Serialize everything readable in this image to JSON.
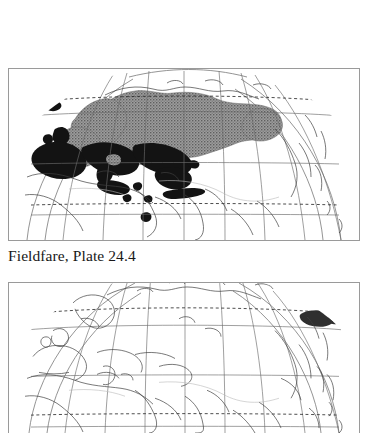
{
  "figure": {
    "caption": "Fieldfare, Plate 24.4",
    "species": "Fieldfare",
    "plate_number": "24.4",
    "background_color": "#ffffff",
    "frame_color": "#9a9a9a"
  },
  "maps": [
    {
      "id": "map-top",
      "name": "fieldfare-distribution-map",
      "projection": "globe-orthographic-eurasia",
      "coastline_color": "#3a3a3a",
      "graticule_color": "#6f6f6f",
      "ranges": [
        {
          "name": "breeding-range",
          "style": "stipple-gray",
          "color": "#8a8a8a",
          "region": "northern Eurasia: Scandinavia, northern and central Russia, Siberia"
        },
        {
          "name": "wintering-range",
          "style": "solid-black",
          "color": "#111111",
          "region": "western and southern Europe, British Isles, Iberia, Mediterranean, Iceland, Caspian and Middle East"
        }
      ],
      "latitude_lines": [
        {
          "label": "Arctic Circle",
          "style": "dashed",
          "y_frac": 0.19
        },
        {
          "label": "60N",
          "style": "solid",
          "y_frac": 0.272
        },
        {
          "label": "40N",
          "style": "solid",
          "y_frac": 0.555
        },
        {
          "label": "Tropic of Cancer",
          "style": "dashed",
          "y_frac": 0.79
        },
        {
          "label": "20N",
          "style": "solid",
          "y_frac": 0.845
        }
      ]
    },
    {
      "id": "map-bottom",
      "name": "second-distribution-map",
      "projection": "globe-orthographic-eurasia",
      "coastline_color": "#3a3a3a",
      "graticule_color": "#6f6f6f",
      "ranges": [
        {
          "name": "range-patch-northeast-asia",
          "style": "solid-dark",
          "color": "#2a2a2a",
          "region": "northeast Asia, Kamchatka and northern Japan"
        }
      ],
      "latitude_lines": [
        {
          "label": "Arctic Circle",
          "style": "dashed",
          "y_frac": 0.21
        },
        {
          "label": "60N",
          "style": "solid",
          "y_frac": 0.3
        },
        {
          "label": "40N",
          "style": "solid",
          "y_frac": 0.6
        },
        {
          "label": "Tropic of Cancer",
          "style": "dashed",
          "y_frac": 0.875
        }
      ]
    }
  ]
}
